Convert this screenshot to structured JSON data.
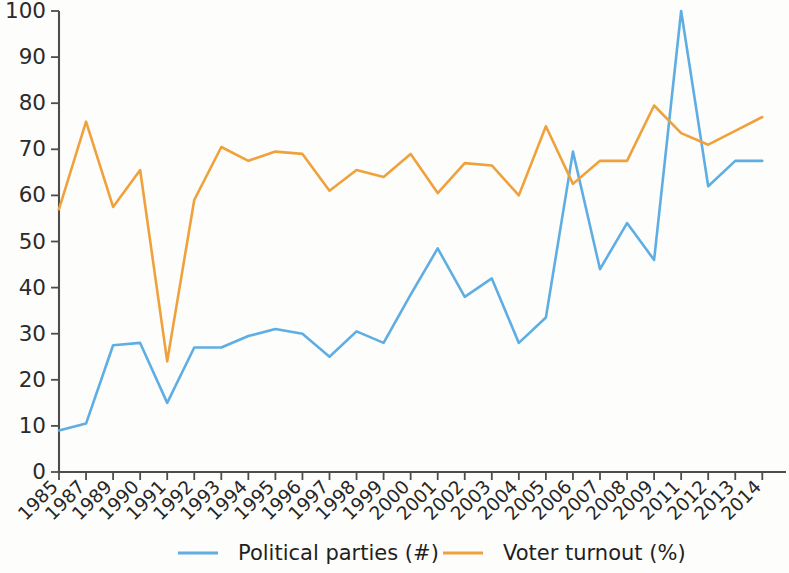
{
  "chart_data": {
    "type": "line",
    "title": "",
    "subtitle": "",
    "xlabel": "",
    "ylabel": "",
    "xlim": [
      0,
      26
    ],
    "ylim": [
      0,
      100
    ],
    "yticks": [
      0,
      10,
      20,
      30,
      40,
      50,
      60,
      70,
      80,
      90,
      100
    ],
    "grid": false,
    "legend_position": "bottom",
    "categories": [
      "1985",
      "1987",
      "1989",
      "1990",
      "1991",
      "1992",
      "1993",
      "1994",
      "1995",
      "1996",
      "1997",
      "1998",
      "1999",
      "2000",
      "2001",
      "2002",
      "2003",
      "2004",
      "2005",
      "2006",
      "2007",
      "2008",
      "2009",
      "2011",
      "2012",
      "2013",
      "2014"
    ],
    "series": [
      {
        "name": "Political parties (#)",
        "color": "#5FAEE3",
        "values": [
          9,
          10.5,
          27.5,
          28,
          15,
          27,
          27,
          29.5,
          31,
          30,
          25,
          30.5,
          28,
          38.5,
          48.5,
          38,
          42,
          28,
          33.5,
          69.5,
          44,
          54,
          46,
          100,
          62,
          67.5,
          67.5
        ]
      },
      {
        "name": "Voter turnout (%)",
        "color": "#EFA13C",
        "values": [
          57,
          76,
          57.5,
          65.5,
          24,
          59,
          70.5,
          67.5,
          69.5,
          69,
          61,
          65.5,
          64,
          69,
          60.5,
          67,
          66.5,
          60,
          75,
          62.5,
          67.5,
          67.5,
          79.5,
          73.5,
          71,
          74,
          77
        ]
      }
    ]
  },
  "legend": {
    "entries": [
      {
        "label": "Political parties (#)",
        "color": "#5FAEE3"
      },
      {
        "label": "Voter turnout (%)",
        "color": "#EFA13C"
      }
    ]
  },
  "axes": {
    "y_tick_labels": [
      "100",
      "90",
      "80",
      "70",
      "60",
      "50",
      "40",
      "30",
      "20",
      "10",
      "0"
    ],
    "x_tick_labels": [
      "1985",
      "1987",
      "1989",
      "1990",
      "1991",
      "1992",
      "1993",
      "1994",
      "1995",
      "1996",
      "1997",
      "1998",
      "1999",
      "2000",
      "2001",
      "2002",
      "2003",
      "2004",
      "2005",
      "2006",
      "2007",
      "2008",
      "2009",
      "2011",
      "2012",
      "2013",
      "2014"
    ]
  },
  "colors": {
    "background": "#fdfdfc",
    "axis": "#4d4d4d",
    "text": "#262626",
    "series_blue": "#5FAEE3",
    "series_orange": "#EFA13C"
  }
}
